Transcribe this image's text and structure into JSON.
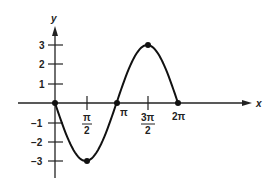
{
  "chart_data": {
    "type": "line",
    "title": "",
    "xlabel": "x",
    "ylabel": "y",
    "function": "y = -3 sin x",
    "x_ticks": [
      "π/2",
      "π",
      "3π/2",
      "2π"
    ],
    "y_ticks": [
      "3",
      "2",
      "1",
      "-1",
      "-2",
      "-3"
    ],
    "ylim": [
      -3,
      3
    ],
    "xlim": [
      0,
      6.2832
    ],
    "grid": false,
    "legend": null,
    "series": [
      {
        "name": "y = -3 sin x",
        "x": [
          0,
          0.3927,
          0.7854,
          1.1781,
          1.5708,
          1.9635,
          2.3562,
          2.7489,
          3.1416,
          3.5343,
          3.927,
          4.3197,
          4.7124,
          5.1051,
          5.4978,
          5.8905,
          6.2832
        ],
        "values": [
          0,
          -1.148,
          -2.121,
          -2.772,
          -3,
          -2.772,
          -2.121,
          -1.148,
          0,
          1.148,
          2.121,
          2.772,
          3,
          2.772,
          2.121,
          1.148,
          0
        ]
      }
    ],
    "marked_points": [
      {
        "x": "0",
        "y": 0
      },
      {
        "x": "π/2",
        "y": -3
      },
      {
        "x": "π",
        "y": 0
      },
      {
        "x": "3π/2",
        "y": 3
      },
      {
        "x": "2π",
        "y": 0
      }
    ]
  },
  "labels": {
    "x_axis": "x",
    "y_axis": "y",
    "y3": "3",
    "y2": "2",
    "y1": "1",
    "yn1": "−1",
    "yn2": "−2",
    "yn3": "−3",
    "pi_half_num": "π",
    "pi_half_den": "2",
    "pi": "π",
    "three_pi_half_num": "3π",
    "three_pi_half_den": "2",
    "two_pi": "2π"
  }
}
